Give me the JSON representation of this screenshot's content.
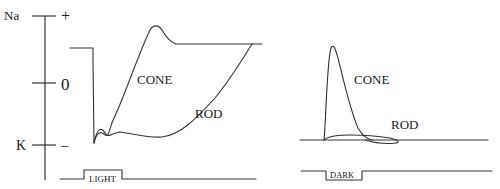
{
  "axis": {
    "top_label": "Na",
    "top_sign": "+",
    "mid_value": "0",
    "bottom_label": "K",
    "bottom_sign": "–"
  },
  "light_panel": {
    "cone_label": "CONE",
    "rod_label": "ROD",
    "stimulus_label": "LIGHT"
  },
  "dark_panel": {
    "cone_label": "CONE",
    "rod_label": "ROD",
    "stimulus_label": "DARK"
  },
  "colors": {
    "ink": "#333333",
    "background": "#ffffff"
  }
}
